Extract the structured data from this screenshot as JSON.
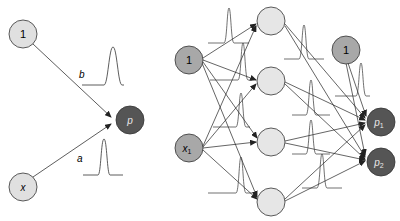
{
  "colors": {
    "input_fill": "#e0e0e0",
    "input_fill_dark": "#a8a8a8",
    "hidden_fill": "#e6e6e6",
    "output_fill": "#555555",
    "stroke": "#333333",
    "output_text": "#e8e8e8"
  },
  "left_network": {
    "nodes": [
      {
        "id": "bias",
        "label": "1"
      },
      {
        "id": "x",
        "label": "x"
      },
      {
        "id": "p",
        "label": "p"
      }
    ],
    "edges": [
      {
        "from": "bias",
        "to": "p",
        "label": "b"
      },
      {
        "from": "x",
        "to": "p",
        "label": "a"
      }
    ]
  },
  "right_network": {
    "inputs": [
      {
        "id": "bias1",
        "label": "1"
      },
      {
        "id": "x1",
        "label": "x",
        "sub": "1"
      }
    ],
    "hidden": [
      {
        "id": "h1"
      },
      {
        "id": "h2"
      },
      {
        "id": "h3"
      },
      {
        "id": "h4"
      }
    ],
    "bias2": {
      "id": "bias2",
      "label": "1"
    },
    "outputs": [
      {
        "id": "p1",
        "label": "p",
        "sub": "1"
      },
      {
        "id": "p2",
        "label": "p",
        "sub": "2"
      }
    ]
  }
}
